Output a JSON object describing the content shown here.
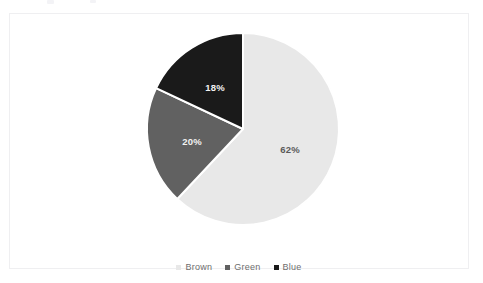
{
  "canvas": {
    "width": 483,
    "height": 283,
    "background": "#ffffff",
    "border_color": "#efeff1"
  },
  "chart_data": {
    "type": "pie",
    "title": "",
    "subtitle": "",
    "xlabel": "",
    "ylabel": "",
    "grid": false,
    "legend_position": "bottom",
    "start_angle_deg": 0,
    "direction": "clockwise",
    "categories": [
      "Brown",
      "Green",
      "Blue"
    ],
    "values": [
      62,
      20,
      18
    ],
    "value_unit": "%",
    "data_labels": [
      "62%",
      "20%",
      "18%"
    ],
    "slice_colors": [
      "#e8e8e8",
      "#616161",
      "#1a1a1a"
    ],
    "label_colors": [
      "#5a5a5a",
      "#f2f2f2",
      "#f2f2f2"
    ],
    "separator_color": "#ffffff",
    "slices": [
      {
        "name": "Brown",
        "value": 62,
        "label": "62%",
        "color": "#e8e8e8",
        "label_color": "#5a5a5a",
        "start_deg": 0,
        "end_deg": 223.2,
        "label_x": 289,
        "label_y": 148
      },
      {
        "name": "Green",
        "value": 20,
        "label": "20%",
        "color": "#616161",
        "label_color": "#f2f2f2",
        "start_deg": 223.2,
        "end_deg": 295.2,
        "label_x": 191,
        "label_y": 140
      },
      {
        "name": "Blue",
        "value": 18,
        "label": "18%",
        "color": "#1a1a1a",
        "label_color": "#f2f2f2",
        "start_deg": 295.2,
        "end_deg": 360,
        "label_x": 214,
        "label_y": 86
      }
    ],
    "geometry": {
      "center_x": 242,
      "center_y": 128,
      "radius": 96
    }
  },
  "legend": {
    "items": [
      {
        "label": "Brown",
        "color": "#e8e8e8"
      },
      {
        "label": "Green",
        "color": "#616161"
      },
      {
        "label": "Blue",
        "color": "#1a1a1a"
      }
    ]
  }
}
